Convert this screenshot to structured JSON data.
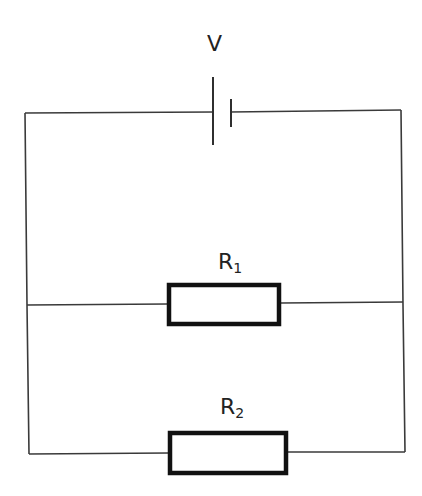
{
  "diagram": {
    "components": {
      "battery": {
        "label": "V",
        "type": "cell"
      },
      "resistor_1": {
        "label": "R",
        "subscript": "1",
        "type": "resistor"
      },
      "resistor_2": {
        "label": "R",
        "subscript": "2",
        "type": "resistor"
      }
    },
    "connections": [
      {
        "from": "battery",
        "to": "resistor_1",
        "relation": "parallel branch"
      },
      {
        "from": "battery",
        "to": "resistor_2",
        "relation": "parallel branch"
      }
    ],
    "colors": {
      "wire": "#3a3a3a",
      "resistor_outline": "#111111",
      "background": "#ffffff"
    }
  }
}
